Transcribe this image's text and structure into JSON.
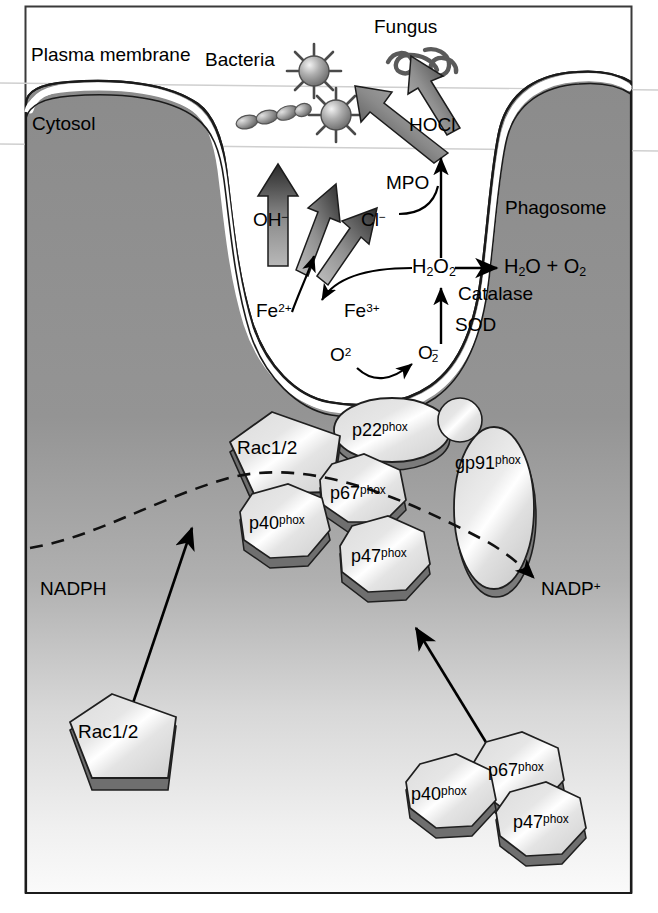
{
  "figure": {
    "frame_color": "#3a3a3a",
    "cytosol_fill_top": "#8c8c8c",
    "cytosol_fill_bottom": "#f2f2f2",
    "membrane_stroke": "#1a1a1a",
    "protein_fill": "#e8e8e8",
    "protein_shadow": "#6e6e6e"
  },
  "compartments": {
    "plasma_membrane_label": "Plasma membrane",
    "cytosol_label": "Cytosol",
    "phagosome_label": "Phagosome"
  },
  "microbes": {
    "bacteria_label": "Bacteria",
    "fungus_label": "Fungus"
  },
  "chemistry": {
    "hocl": "HOCl",
    "mpo": "MPO",
    "chloride_ion": "Cl",
    "chloride_charge": "−",
    "hydroxyl_ion": "OH",
    "hydroxyl_charge": "−",
    "hydrogen_peroxide": "H",
    "hydrogen_peroxide_sub1": "2",
    "hydrogen_peroxide_o": "O",
    "hydrogen_peroxide_sub2": "2",
    "water": "H",
    "water_sub": "2",
    "water_o": "O",
    "plus": "+",
    "oxygen": "O",
    "oxygen_sub": "2",
    "catalase": "Catalase",
    "sod": "SOD",
    "ferrous": "Fe",
    "ferrous_charge": "2+",
    "ferric": "Fe",
    "ferric_charge": "3+",
    "molecular_oxygen": "O",
    "molecular_oxygen_sup": "2",
    "superoxide": "O",
    "superoxide_sub": "2",
    "superoxide_charge": "−",
    "nadph": "NADPH",
    "nadp_plus": "NADP",
    "nadp_plus_charge": "+"
  },
  "proteins": {
    "assembled": [
      {
        "name": "Rac1/2",
        "shape": "pentagon"
      },
      {
        "name": "p22",
        "suffix": "phox",
        "shape": "ellipse"
      },
      {
        "name": "gp91",
        "suffix": "phox",
        "shape": "ellipse"
      },
      {
        "name": "p67",
        "suffix": "phox",
        "shape": "octagon"
      },
      {
        "name": "p40",
        "suffix": "phox",
        "shape": "octagon"
      },
      {
        "name": "p47",
        "suffix": "phox",
        "shape": "octagon"
      }
    ],
    "cytosolic": [
      {
        "name": "Rac1/2",
        "shape": "pentagon"
      },
      {
        "name": "p67",
        "suffix": "phox",
        "shape": "octagon"
      },
      {
        "name": "p40",
        "suffix": "phox",
        "shape": "octagon"
      },
      {
        "name": "p47",
        "suffix": "phox",
        "shape": "octagon"
      }
    ]
  }
}
